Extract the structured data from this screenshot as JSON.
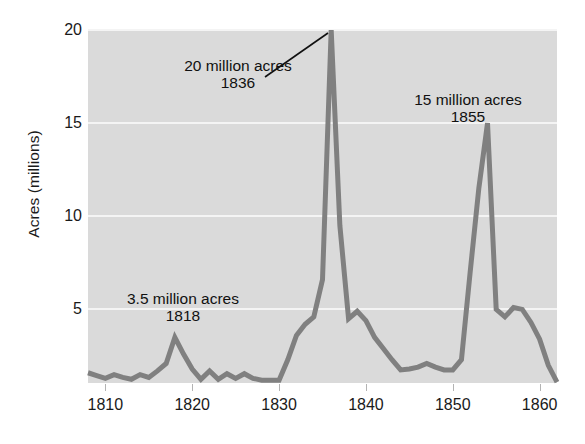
{
  "chart_data": {
    "type": "line",
    "title": "",
    "xlabel": "",
    "ylabel": "Acres (millions)",
    "xlim": [
      1808,
      1862
    ],
    "ylim": [
      1.05,
      20
    ],
    "grid": true,
    "legend": "none",
    "line_color": "#808080",
    "panel_color": "#dadada",
    "gridline_color": "#f4f4f4",
    "x_ticks": [
      1810,
      1820,
      1830,
      1840,
      1850,
      1860
    ],
    "x_tick_labels": [
      "1810",
      "1820",
      "1830",
      "1840",
      "1850",
      "1860"
    ],
    "y_ticks": [
      5,
      10,
      15,
      20
    ],
    "y_tick_labels": [
      "5",
      "10",
      "15",
      "20"
    ],
    "series": [
      {
        "name": "Public land sales",
        "x": [
          1808,
          1809,
          1810,
          1811,
          1812,
          1813,
          1814,
          1815,
          1816,
          1817,
          1818,
          1819,
          1820,
          1821,
          1822,
          1823,
          1824,
          1825,
          1826,
          1827,
          1828,
          1829,
          1830,
          1831,
          1832,
          1833,
          1834,
          1835,
          1836,
          1837,
          1838,
          1839,
          1840,
          1841,
          1842,
          1843,
          1844,
          1845,
          1846,
          1847,
          1848,
          1849,
          1850,
          1851,
          1852,
          1853,
          1854,
          1855,
          1856,
          1857,
          1858,
          1859,
          1860,
          1861,
          1862
        ],
        "y": [
          1.6,
          1.45,
          1.3,
          1.5,
          1.35,
          1.25,
          1.5,
          1.35,
          1.7,
          2.1,
          3.5,
          2.6,
          1.8,
          1.25,
          1.7,
          1.25,
          1.55,
          1.3,
          1.55,
          1.3,
          1.2,
          1.2,
          1.2,
          2.3,
          3.6,
          4.2,
          4.6,
          6.6,
          20.0,
          9.5,
          4.5,
          4.9,
          4.4,
          3.5,
          2.9,
          2.3,
          1.75,
          1.8,
          1.9,
          2.1,
          1.9,
          1.75,
          1.75,
          2.3,
          7.0,
          11.5,
          15.0,
          5.0,
          4.6,
          5.1,
          5.0,
          4.3,
          3.4,
          2.0,
          1.1
        ]
      }
    ],
    "annotations": [
      {
        "id": "peak-1836",
        "line1": "20 million acres",
        "line2": "1836",
        "value": 20,
        "year": 1836,
        "has_leader_line": true
      },
      {
        "id": "peak-1855",
        "line1": "15 million acres",
        "line2": "1855",
        "value": 15,
        "year": 1855,
        "has_leader_line": false
      },
      {
        "id": "peak-1818",
        "line1": "3.5 million acres",
        "line2": "1818",
        "value": 3.5,
        "year": 1818,
        "has_leader_line": false
      }
    ]
  }
}
